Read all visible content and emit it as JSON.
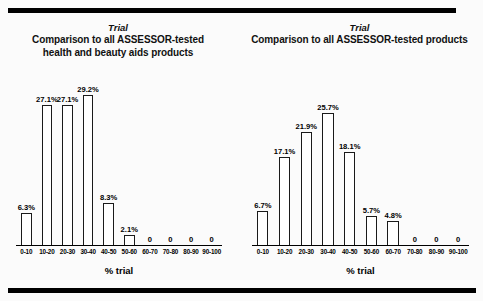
{
  "figure": {
    "background_color": "#fbfbfb",
    "rule_color": "#000000"
  },
  "chart_data": [
    {
      "type": "bar",
      "id": "left",
      "title": "Trial",
      "subtitle": "Comparison to all ASSESSOR-tested health and beauty aids products",
      "subtitle_line1": "Comparison to all ASSESSOR-tested",
      "subtitle_line2": "health and beauty aids products",
      "xlabel": "% trial",
      "ylabel": "",
      "grid": false,
      "legend": "none",
      "ylim": [
        0,
        32
      ],
      "categories": [
        "0-10",
        "10-20",
        "20-30",
        "30-40",
        "40-50",
        "50-60",
        "60-70",
        "70-80",
        "80-90",
        "90-100"
      ],
      "values": [
        6.3,
        27.1,
        27.1,
        29.2,
        8.3,
        2.1,
        0,
        0,
        0,
        0
      ],
      "data_labels": [
        "6.3%",
        "27.1%",
        "27.1%",
        "29.2%",
        "8.3%",
        "2.1%",
        "0",
        "0",
        "0",
        "0"
      ]
    },
    {
      "type": "bar",
      "id": "right",
      "title": "Trial",
      "subtitle": "Comparison to all ASSESSOR-tested products",
      "subtitle_line1": "Comparison to all ASSESSOR-tested products",
      "subtitle_line2": "",
      "xlabel": "% trial",
      "ylabel": "",
      "grid": false,
      "legend": "none",
      "ylim": [
        0,
        32
      ],
      "categories": [
        "0-10",
        "10-20",
        "20-30",
        "30-40",
        "40-50",
        "50-60",
        "60-70",
        "70-80",
        "80-90",
        "90-100"
      ],
      "values": [
        6.7,
        17.1,
        21.9,
        25.7,
        18.1,
        5.7,
        4.8,
        0,
        0,
        0
      ],
      "data_labels": [
        "6.7%",
        "17.1%",
        "21.9%",
        "25.7%",
        "18.1%",
        "5.7%",
        "4.8%",
        "0",
        "0",
        "0"
      ]
    }
  ]
}
